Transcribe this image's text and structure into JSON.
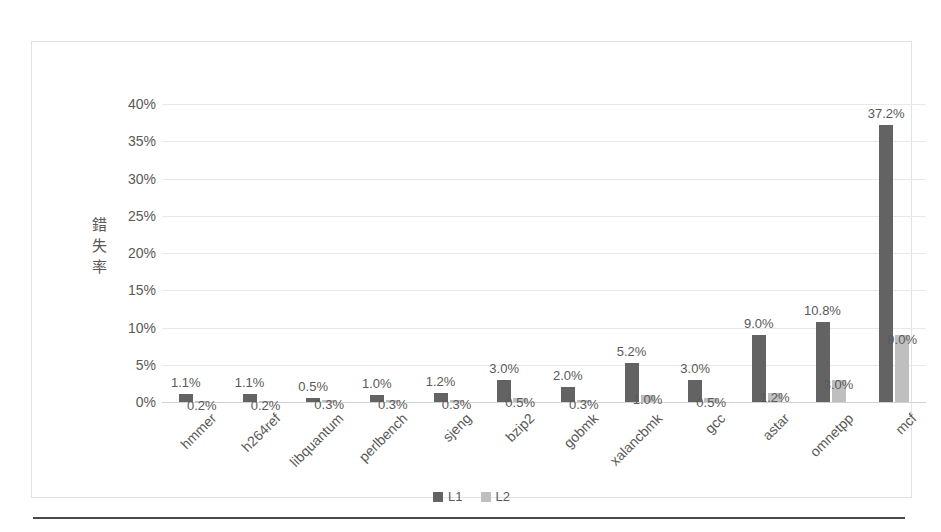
{
  "chart_data": {
    "type": "bar",
    "title": "",
    "xlabel": "",
    "ylabel": "錯失率",
    "ylabel_chars": [
      "錯",
      "失",
      "率"
    ],
    "ylim": [
      0,
      40
    ],
    "ytick_labels": [
      "40%",
      "35%",
      "30%",
      "25%",
      "20%",
      "15%",
      "10%",
      "5%",
      "0%"
    ],
    "ytick_values": [
      40,
      35,
      30,
      25,
      20,
      15,
      10,
      5,
      0
    ],
    "grid": true,
    "legend_position": "bottom",
    "categories": [
      "hmmer",
      "h264ref",
      "libquantum",
      "perlbench",
      "sjeng",
      "bzip2",
      "gobmk",
      "xalancbmk",
      "gcc",
      "astar",
      "omnetpp",
      "mcf"
    ],
    "series": [
      {
        "name": "L1",
        "color": "#636363",
        "values": [
          1.1,
          1.1,
          0.5,
          1.0,
          1.2,
          3.0,
          2.0,
          5.2,
          3.0,
          9.0,
          10.8,
          37.2
        ],
        "labels": [
          "1.1%",
          "1.1%",
          "0.5%",
          "1.0%",
          "1.2%",
          "3.0%",
          "2.0%",
          "5.2%",
          "3.0%",
          "9.0%",
          "10.8%",
          "37.2%"
        ]
      },
      {
        "name": "L2",
        "color": "#bfbfbf",
        "values": [
          0.2,
          0.2,
          0.3,
          0.3,
          0.3,
          0.5,
          0.3,
          1.0,
          0.5,
          1.2,
          3.0,
          9.0
        ],
        "labels": [
          "0.2%",
          "0.2%",
          "0.3%",
          "0.3%",
          "0.3%",
          "0.5%",
          "0.3%",
          "1.0%",
          "0.5%",
          "1.2%",
          "3.0%",
          "9.0%"
        ]
      }
    ]
  },
  "legend": {
    "items": [
      {
        "label": "L1",
        "color": "#636363"
      },
      {
        "label": "L2",
        "color": "#bfbfbf"
      }
    ]
  },
  "colors": {
    "l1": "#636363",
    "l2": "#bfbfbf",
    "text": "#595959",
    "grid": "#e8e8e8",
    "frame": "#e2e2e2",
    "rule": "#4a4a4a"
  }
}
